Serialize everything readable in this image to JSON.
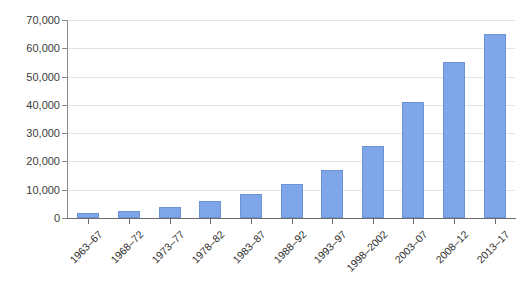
{
  "chart_data": {
    "type": "bar",
    "title": "",
    "subtitle": "",
    "xlabel": "",
    "ylabel": "",
    "categories": [
      "1963–67",
      "1968–72",
      "1973–77",
      "1978–82",
      "1983–87",
      "1988–92",
      "1993–97",
      "1998–2002",
      "2003–07",
      "2008–12",
      "2013–17"
    ],
    "values": [
      1700,
      2600,
      4000,
      5900,
      8500,
      12200,
      16800,
      25500,
      41000,
      55000,
      65000
    ],
    "ylim": [
      0,
      70000
    ],
    "ytick_values": [
      0,
      10000,
      20000,
      30000,
      40000,
      50000,
      60000,
      70000
    ],
    "ytick_labels": [
      "0",
      "10,000",
      "20,000",
      "30,000",
      "40,000",
      "50,000",
      "60,000",
      "70,000"
    ],
    "grid": true,
    "legend": false,
    "legend_position": "none",
    "series_color": "#7ea6e8",
    "series_border_color": "#6b93d6",
    "gridline_color": "#e3e3e3",
    "axis_color": "#6b6b6b",
    "background_color": "#ffffff"
  }
}
